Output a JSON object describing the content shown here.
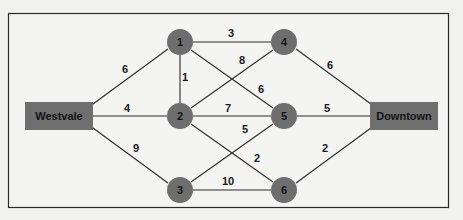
{
  "diagram": {
    "type": "weighted network graph",
    "terminals": {
      "source": {
        "id": "W",
        "label": "Westvale"
      },
      "sink": {
        "id": "D",
        "label": "Downtown"
      }
    },
    "nodes": [
      {
        "id": "1",
        "label": "1"
      },
      {
        "id": "2",
        "label": "2"
      },
      {
        "id": "3",
        "label": "3"
      },
      {
        "id": "4",
        "label": "4"
      },
      {
        "id": "5",
        "label": "5"
      },
      {
        "id": "6",
        "label": "6"
      }
    ],
    "edges": [
      {
        "from": "Westvale",
        "to": "1",
        "weight": "6"
      },
      {
        "from": "Westvale",
        "to": "2",
        "weight": "4"
      },
      {
        "from": "Westvale",
        "to": "3",
        "weight": "9"
      },
      {
        "from": "1",
        "to": "4",
        "weight": "3"
      },
      {
        "from": "1",
        "to": "2",
        "weight": "1"
      },
      {
        "from": "1",
        "to": "5",
        "weight": "6"
      },
      {
        "from": "2",
        "to": "4",
        "weight": "8"
      },
      {
        "from": "2",
        "to": "5",
        "weight": "7"
      },
      {
        "from": "2",
        "to": "6",
        "weight": "2"
      },
      {
        "from": "3",
        "to": "5",
        "weight": "5"
      },
      {
        "from": "3",
        "to": "6",
        "weight": "10"
      },
      {
        "from": "4",
        "to": "Downtown",
        "weight": "6"
      },
      {
        "from": "5",
        "to": "Downtown",
        "weight": "5"
      },
      {
        "from": "6",
        "to": "Downtown",
        "weight": "2"
      }
    ]
  }
}
